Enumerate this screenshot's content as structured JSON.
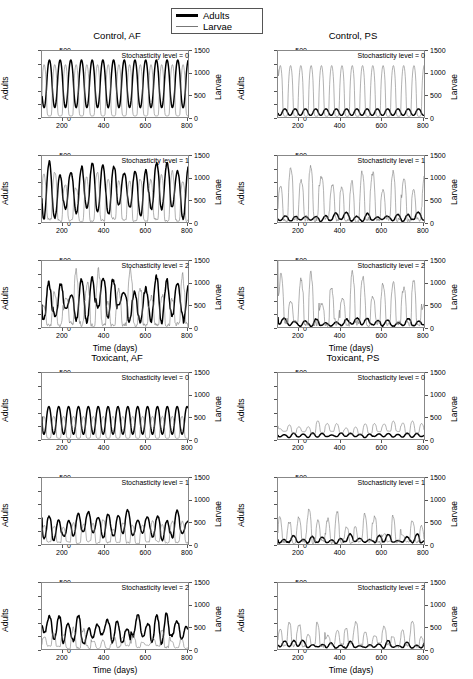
{
  "figure": {
    "legend": {
      "entries": [
        {
          "label": "Adults",
          "style": "thick",
          "color": "#000000"
        },
        {
          "label": "Larvae",
          "style": "thin",
          "color": "#777777"
        }
      ]
    },
    "axes": {
      "xlabel": "Time (days)",
      "ylabel_left": "Adults",
      "ylabel_right": "Larvae",
      "xticks": [
        200,
        400,
        600,
        800
      ],
      "yticks_left": [
        0,
        100,
        200,
        300,
        400,
        500
      ],
      "yticks_right": [
        0,
        500,
        1000,
        1500
      ],
      "xlim": [
        100,
        810
      ],
      "ylim_left": [
        0,
        500
      ],
      "ylim_right": [
        0,
        1500
      ]
    },
    "groups": [
      {
        "key": "control_af",
        "title": "Control, AF"
      },
      {
        "key": "control_ps",
        "title": "Control, PS"
      },
      {
        "key": "toxicant_af",
        "title": "Toxicant, AF"
      },
      {
        "key": "toxicant_ps",
        "title": "Toxicant, PS"
      }
    ],
    "annotations": [
      "Stochasticity level = 0",
      "Stochasticity level = 1",
      "Stochasticity level = 2"
    ]
  },
  "chart_data": {
    "type": "line",
    "title": "",
    "xlabel": "Time (days)",
    "ylabel": "Adults",
    "ylabel_secondary": "Larvae",
    "xlim": [
      100,
      810
    ],
    "ylim": [
      0,
      500
    ],
    "ylim_secondary": [
      0,
      1500
    ],
    "grid": false,
    "legend_position": "top-center",
    "panels": [
      {
        "group": "Control, AF",
        "stochasticity_level": 0,
        "annotation": "Stochasticity level = 0",
        "series": [
          {
            "name": "Adults",
            "axis": "left",
            "period_days": 52,
            "peak_range": [
              380,
              435
            ],
            "trough_range": [
              40,
              110
            ],
            "start_value": 160,
            "noise": 0.0,
            "phase_deg": 200
          },
          {
            "name": "Larvae",
            "axis": "right",
            "period_days": 52,
            "peak_range": [
              950,
              1200
            ],
            "trough_range": [
              0,
              60
            ],
            "start_value": 480,
            "noise": 0.0,
            "phase_deg": 20
          }
        ]
      },
      {
        "group": "Control, AF",
        "stochasticity_level": 1,
        "annotation": "Stochasticity level = 1",
        "series": [
          {
            "name": "Adults",
            "axis": "left",
            "period_days": 52,
            "peak_range": [
              330,
              470
            ],
            "trough_range": [
              20,
              130
            ],
            "start_value": 180,
            "noise": 0.18,
            "phase_deg": 200
          },
          {
            "name": "Larvae",
            "axis": "right",
            "period_days": 52,
            "peak_range": [
              800,
              1250
            ],
            "trough_range": [
              0,
              80
            ],
            "start_value": 420,
            "noise": 0.2,
            "phase_deg": 20
          }
        ]
      },
      {
        "group": "Control, AF",
        "stochasticity_level": 2,
        "annotation": "Stochasticity level = 2",
        "series": [
          {
            "name": "Adults",
            "axis": "left",
            "period_days": 52,
            "peak_range": [
              220,
              430
            ],
            "trough_range": [
              30,
              170
            ],
            "start_value": 170,
            "noise": 0.38,
            "phase_deg": 200
          },
          {
            "name": "Larvae",
            "axis": "right",
            "period_days": 52,
            "peak_range": [
              450,
              1400
            ],
            "trough_range": [
              0,
              120
            ],
            "start_value": 380,
            "noise": 0.45,
            "phase_deg": 20
          }
        ]
      },
      {
        "group": "Control, PS",
        "stochasticity_level": 0,
        "annotation": "Stochasticity level = 0",
        "series": [
          {
            "name": "Adults",
            "axis": "left",
            "period_days": 50,
            "peak_range": [
              45,
              62
            ],
            "trough_range": [
              8,
              18
            ],
            "start_value": 30,
            "noise": 0.0,
            "phase_deg": 210
          },
          {
            "name": "Larvae",
            "axis": "right",
            "period_days": 50,
            "peak_range": [
              700,
              1180
            ],
            "trough_range": [
              0,
              40
            ],
            "start_value": 1080,
            "noise": 0.0,
            "phase_deg": 10
          }
        ]
      },
      {
        "group": "Control, PS",
        "stochasticity_level": 1,
        "annotation": "Stochasticity level = 1",
        "series": [
          {
            "name": "Adults",
            "axis": "left",
            "period_days": 50,
            "peak_range": [
              35,
              75
            ],
            "trough_range": [
              3,
              20
            ],
            "start_value": 25,
            "noise": 0.3,
            "phase_deg": 210
          },
          {
            "name": "Larvae",
            "axis": "right",
            "period_days": 50,
            "peak_range": [
              550,
              1250
            ],
            "trough_range": [
              0,
              90
            ],
            "start_value": 300,
            "noise": 0.38,
            "phase_deg": 10
          }
        ]
      },
      {
        "group": "Control, PS",
        "stochasticity_level": 2,
        "annotation": "Stochasticity level = 2",
        "series": [
          {
            "name": "Adults",
            "axis": "left",
            "period_days": 50,
            "peak_range": [
              30,
              70
            ],
            "trough_range": [
              2,
              20
            ],
            "start_value": 75,
            "noise": 0.45,
            "phase_deg": 210
          },
          {
            "name": "Larvae",
            "axis": "right",
            "period_days": 50,
            "peak_range": [
              400,
              1300
            ],
            "trough_range": [
              0,
              120
            ],
            "start_value": 1500,
            "noise": 0.5,
            "phase_deg": 10
          }
        ]
      },
      {
        "group": "Toxicant, AF",
        "stochasticity_level": 0,
        "annotation": "Stochasticity level = 0",
        "series": [
          {
            "name": "Adults",
            "axis": "left",
            "period_days": 48,
            "peak_range": [
              200,
              248
            ],
            "trough_range": [
              20,
              55
            ],
            "start_value": 170,
            "noise": 0.0,
            "phase_deg": 200
          },
          {
            "name": "Larvae",
            "axis": "right",
            "period_days": 48,
            "peak_range": [
              400,
              520
            ],
            "trough_range": [
              0,
              40
            ],
            "start_value": 120,
            "noise": 0.0,
            "phase_deg": 20
          }
        ]
      },
      {
        "group": "Toxicant, AF",
        "stochasticity_level": 1,
        "annotation": "Stochasticity level = 1",
        "series": [
          {
            "name": "Adults",
            "axis": "left",
            "period_days": 48,
            "peak_range": [
              170,
              265
            ],
            "trough_range": [
              25,
              90
            ],
            "start_value": 200,
            "noise": 0.22,
            "phase_deg": 200
          },
          {
            "name": "Larvae",
            "axis": "right",
            "period_days": 48,
            "peak_range": [
              330,
              560
            ],
            "trough_range": [
              0,
              60
            ],
            "start_value": 150,
            "noise": 0.25,
            "phase_deg": 20
          }
        ]
      },
      {
        "group": "Toxicant, AF",
        "stochasticity_level": 2,
        "annotation": "Stochasticity level = 2",
        "series": [
          {
            "name": "Adults",
            "axis": "left",
            "period_days": 48,
            "peak_range": [
              150,
              305
            ],
            "trough_range": [
              30,
              120
            ],
            "start_value": 180,
            "noise": 0.45,
            "phase_deg": 200
          },
          {
            "name": "Larvae",
            "axis": "right",
            "period_days": 48,
            "peak_range": [
              150,
              520
            ],
            "trough_range": [
              0,
              90
            ],
            "start_value": 100,
            "noise": 0.5,
            "phase_deg": 20
          }
        ]
      },
      {
        "group": "Toxicant, PS",
        "stochasticity_level": 0,
        "annotation": "Stochasticity level = 0",
        "series": [
          {
            "name": "Adults",
            "axis": "left",
            "period_days": 46,
            "peak_range": [
              30,
              48
            ],
            "trough_range": [
              10,
              20
            ],
            "start_value": 30,
            "noise": 0.05,
            "phase_deg": 210
          },
          {
            "name": "Larvae",
            "axis": "right",
            "period_days": 46,
            "peak_range": [
              230,
              420
            ],
            "trough_range": [
              90,
              180
            ],
            "start_value": 300,
            "noise": 0.12,
            "phase_deg": 15
          }
        ]
      },
      {
        "group": "Toxicant, PS",
        "stochasticity_level": 1,
        "annotation": "Stochasticity level = 1",
        "series": [
          {
            "name": "Adults",
            "axis": "left",
            "period_days": 46,
            "peak_range": [
              25,
              80
            ],
            "trough_range": [
              3,
              18
            ],
            "start_value": 35,
            "noise": 0.4,
            "phase_deg": 210
          },
          {
            "name": "Larvae",
            "axis": "right",
            "period_days": 46,
            "peak_range": [
              200,
              790
            ],
            "trough_range": [
              0,
              90
            ],
            "start_value": 250,
            "noise": 0.5,
            "phase_deg": 15
          }
        ]
      },
      {
        "group": "Toxicant, PS",
        "stochasticity_level": 2,
        "annotation": "Stochasticity level = 2",
        "series": [
          {
            "name": "Adults",
            "axis": "left",
            "period_days": 46,
            "peak_range": [
              25,
              70
            ],
            "trough_range": [
              5,
              20
            ],
            "start_value": 30,
            "noise": 0.35,
            "phase_deg": 210
          },
          {
            "name": "Larvae",
            "axis": "right",
            "period_days": 46,
            "peak_range": [
              250,
              660
            ],
            "trough_range": [
              40,
              140
            ],
            "start_value": 200,
            "noise": 0.42,
            "phase_deg": 15
          }
        ]
      }
    ]
  }
}
